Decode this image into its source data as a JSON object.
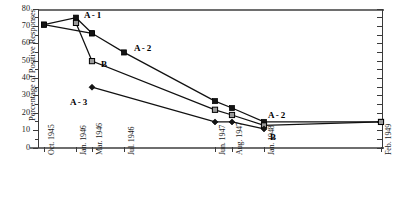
{
  "chart_data": {
    "type": "line",
    "title": "",
    "xlabel": "",
    "ylabel": "Percentage of Positive Responses",
    "ylim": [
      0,
      80
    ],
    "ytick_values": [
      0,
      10,
      20,
      30,
      40,
      50,
      60,
      70,
      80
    ],
    "ytick_labels": [
      "0",
      "10",
      "20",
      "30",
      "40",
      "50",
      "60",
      "70",
      "80"
    ],
    "grid": false,
    "legend": "inline annotations",
    "x_categories": [
      "Oct. 1945",
      "Jan. 1946",
      "Mar. 1946",
      "Jul. 1946",
      "Jun. 1947",
      "Aug. 1947",
      "Jan. 1948",
      "Feb. 1949"
    ],
    "xtick_labels": [
      "Oct. 1945",
      "Jan. 1946",
      "Mar. 1946",
      "Jul. 1946",
      "Jun. 1947",
      "Aug. 1947",
      "Jan. 1948",
      "Feb. 1949"
    ],
    "series": [
      {
        "name": "A-1",
        "marker": "filled-square",
        "points": [
          {
            "x": "Oct. 1945",
            "y": 71
          },
          {
            "x": "Jan. 1946",
            "y": 75
          },
          {
            "x": "Mar. 1946",
            "y": 66
          }
        ]
      },
      {
        "name": "A-2",
        "marker": "filled-square",
        "points": [
          {
            "x": "Oct. 1945",
            "y": 71
          },
          {
            "x": "Mar. 1946",
            "y": 66
          },
          {
            "x": "Jul. 1946",
            "y": 55
          },
          {
            "x": "Jun. 1947",
            "y": 27
          },
          {
            "x": "Aug. 1947",
            "y": 23
          },
          {
            "x": "Jan. 1948",
            "y": 15
          },
          {
            "x": "Feb. 1949",
            "y": 15
          }
        ]
      },
      {
        "name": "B",
        "marker": "hatched-square",
        "points": [
          {
            "x": "Jan. 1946",
            "y": 72
          },
          {
            "x": "Mar. 1946",
            "y": 50
          },
          {
            "x": "Jun. 1947",
            "y": 22
          },
          {
            "x": "Aug. 1947",
            "y": 19
          },
          {
            "x": "Jan. 1948",
            "y": 13
          },
          {
            "x": "Feb. 1949",
            "y": 15
          }
        ]
      },
      {
        "name": "A-3",
        "marker": "filled-diamond",
        "points": [
          {
            "x": "Mar. 1946",
            "y": 35
          },
          {
            "x": "Jun. 1947",
            "y": 15
          },
          {
            "x": "Aug. 1947",
            "y": 15
          },
          {
            "x": "Jan. 1948",
            "y": 11
          }
        ]
      }
    ],
    "annotations": [
      {
        "label": "A - 1",
        "x": "Jan. 1946",
        "y": 77
      },
      {
        "label": "A - 2",
        "x": "Jul. 1946",
        "y": 58
      },
      {
        "label": "B",
        "x": "Mar. 1946",
        "y": 49
      },
      {
        "label": "A - 3",
        "x": "Mar. 1946",
        "y": 29
      },
      {
        "label": "A - 2",
        "x": "Jan. 1948",
        "y": 20
      },
      {
        "label": "B",
        "x": "Jan. 1948",
        "y": 8
      }
    ],
    "colors": {
      "line": "#111111",
      "axis": "#3a3a3a",
      "frame": "#6e6e6e",
      "marker_fill": "#141414",
      "marker_b_fill": "#9a9a9a",
      "text": "#111111"
    }
  }
}
